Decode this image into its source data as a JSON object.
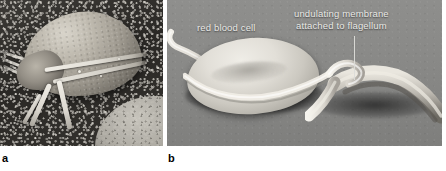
{
  "figure": {
    "type": "scanning-electron-micrograph-figure",
    "panel_count": 2
  },
  "panels": [
    {
      "id": "a",
      "letter": "a",
      "letter_color": "#000000",
      "background_color": "#34322f",
      "description": "scanning electron micrograph of a flagellated protozoan parasite on a dark granular substrate",
      "annotations": []
    },
    {
      "id": "b",
      "letter": "b",
      "letter_color": "#000000",
      "background_color": "#8a8a88",
      "description": "scanning electron micrograph of a trypanosome alongside a red blood cell on a smooth grey substrate",
      "annotations": [
        {
          "name": "red-blood-cell",
          "text": "red blood cell",
          "text_color": "#e9e9e6",
          "has_leader_line": false
        },
        {
          "name": "undulating-membrane",
          "line1": "undulating membrane",
          "line2": "attached to flagellum",
          "text_color": "#e9e9e6",
          "has_leader_line": true,
          "leader_line_color": "#dcdcd8"
        }
      ]
    }
  ]
}
